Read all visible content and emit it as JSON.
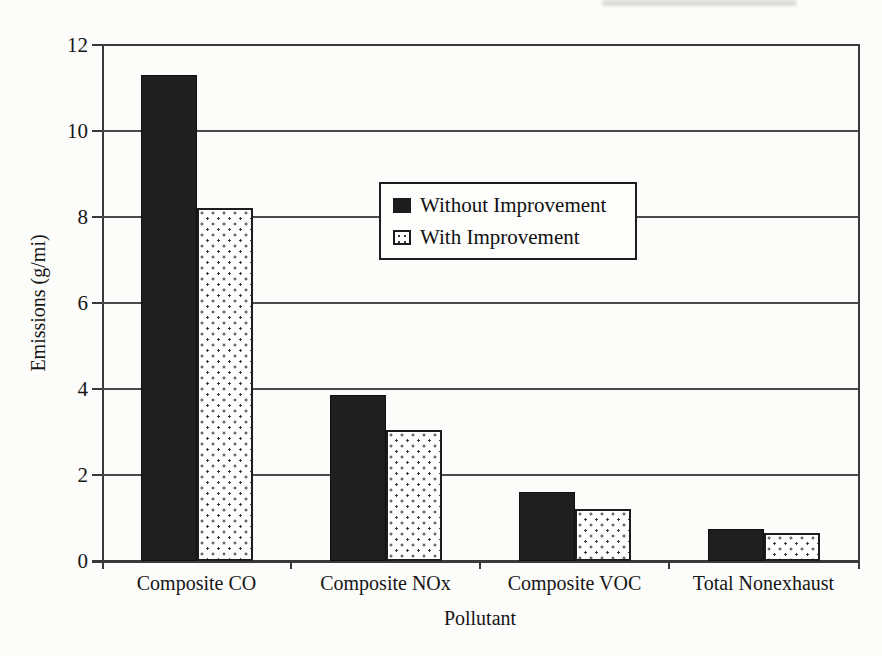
{
  "chart_data": {
    "type": "bar",
    "title": "",
    "categories": [
      "Composite CO",
      "Composite NOx",
      "Composite VOC",
      "Total Nonexhaust"
    ],
    "series": [
      {
        "name": "Without Improvement",
        "fill": "solid-black",
        "values": [
          11.3,
          3.85,
          1.6,
          0.75
        ]
      },
      {
        "name": "With Improvement",
        "fill": "dotted-white",
        "values": [
          8.2,
          3.05,
          1.2,
          0.65
        ]
      }
    ],
    "xlabel": "Pollutant",
    "ylabel": "Emissions (g/mi)",
    "ylim": [
      0,
      12
    ],
    "yticks": [
      0,
      2,
      4,
      6,
      8,
      10,
      12
    ],
    "grid": "horizontal",
    "legend_position": "upper-middle",
    "legend_border": true
  },
  "colors": {
    "bar_solid": "#1f1f1f",
    "dot_pattern": "#3a3a3a",
    "axis_line": "#3a3a3a",
    "gridline": "#4a4a4a",
    "background": "#fcfcfa",
    "text": "#161616"
  }
}
